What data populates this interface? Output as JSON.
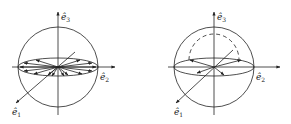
{
  "diagrams": [
    {
      "id": "left",
      "axis_labels": {
        "e1": "ê",
        "e1_sub": "1",
        "e2": "ê",
        "e2_sub": "2",
        "e3": "ê",
        "e3_sub": "3"
      },
      "description": "Sphere with equatorial ellipse and radial arrows from center to equator"
    },
    {
      "id": "right",
      "axis_labels": {
        "e1": "ê",
        "e1_sub": "1",
        "e2": "ê",
        "e2_sub": "2",
        "e3": "ê",
        "e3_sub": "3"
      },
      "description": "Sphere with equatorial ellipse, dashed upper arc, few arrows"
    }
  ],
  "colors": {
    "stroke": "#222222",
    "background": "#ffffff"
  }
}
